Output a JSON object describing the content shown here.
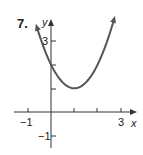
{
  "problem_number": "7.",
  "chart_data": {
    "type": "line",
    "title": "",
    "xlabel": "x",
    "ylabel": "y",
    "function": "y = (x - 1)^2 + 1",
    "vertex": [
      1,
      1
    ],
    "y_intercept": [
      0,
      2
    ],
    "x_ticks": [
      -1,
      0,
      1,
      2,
      3
    ],
    "x_tick_labels": [
      "-1",
      "3"
    ],
    "y_ticks": [
      -1,
      1,
      2,
      3
    ],
    "y_tick_labels": [
      "3",
      "-1"
    ],
    "xlim": [
      -1.4,
      3.4
    ],
    "ylim": [
      -1.6,
      4
    ],
    "arrows_both_ends": true,
    "grid": false,
    "curve_color": "#555555",
    "series": [
      {
        "name": "parabola",
        "x": [
          -0.6,
          -0.25,
          0,
          0.5,
          1,
          1.5,
          2,
          2.5,
          2.7
        ],
        "y": [
          3.56,
          2.56,
          2,
          1.25,
          1,
          1.25,
          2,
          3.25,
          3.89
        ]
      }
    ]
  }
}
